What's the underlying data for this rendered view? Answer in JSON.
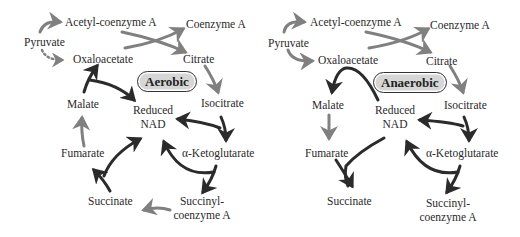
{
  "colors": {
    "gray_arrow": "#808080",
    "dark_arrow": "#2b2b2b",
    "badge_fill": "#d6d6d6",
    "text": "#2a2a2a"
  },
  "panels": [
    {
      "badge": "Aerobic",
      "nodes": {
        "pyruvate": "Pyruvate",
        "acetyl_coa": "Acetyl-coenzyme A",
        "coenzyme_a": "Coenzyme A",
        "oxaloacetate": "Oxaloacetate",
        "citrate": "Citrate",
        "isocitrate": "Isocitrate",
        "malate": "Malate",
        "reduced_nad_1": "Reduced",
        "reduced_nad_2": "NAD",
        "fumarate": "Fumarate",
        "ketoglutarate": "α-Ketoglutarate",
        "succinate": "Succinate",
        "succinyl_1": "Succinyl-",
        "succinyl_2": "coenzyme A"
      }
    },
    {
      "badge": "Anaerobic",
      "nodes": {
        "pyruvate": "Pyruvate",
        "acetyl_coa": "Acetyl-coenzyme A",
        "coenzyme_a": "Coenzyme A",
        "oxaloacetate": "Oxaloacetate",
        "citrate": "Citrate",
        "isocitrate": "Isocitrate",
        "malate": "Malate",
        "reduced_nad_1": "Reduced",
        "reduced_nad_2": "NAD",
        "fumarate": "Fumarate",
        "ketoglutarate": "α-Ketoglutarate",
        "succinate": "Succinate",
        "succinyl_1": "Succinyl-",
        "succinyl_2": "coenzyme A"
      }
    }
  ]
}
